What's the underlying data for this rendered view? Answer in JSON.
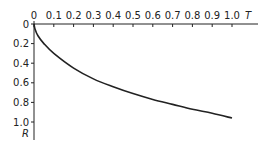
{
  "chart_data": {
    "type": "line",
    "title": "",
    "xlabel": "T",
    "ylabel": "R",
    "x_axis_position": "top",
    "y_axis_inverted": true,
    "xlim": [
      0,
      1.0
    ],
    "ylim": [
      0,
      1.0
    ],
    "grid": false,
    "legend": null,
    "x_ticks": [
      "0",
      "0.1",
      "0.2",
      "0.3",
      "0.4",
      "0.5",
      "0.6",
      "0.7",
      "0.8",
      "0.9",
      "1.0"
    ],
    "y_ticks": [
      "0",
      "0.2",
      "0.4",
      "0.6",
      "0.8",
      "1.0"
    ],
    "series": [
      {
        "name": "R(T)",
        "color": "#222222",
        "x": [
          0,
          0.005,
          0.02,
          0.05,
          0.1,
          0.2,
          0.3,
          0.4,
          0.5,
          0.6,
          0.7,
          0.8,
          0.9,
          1.0
        ],
        "y": [
          0,
          0.05,
          0.12,
          0.2,
          0.3,
          0.45,
          0.56,
          0.64,
          0.71,
          0.77,
          0.82,
          0.87,
          0.91,
          0.96
        ]
      }
    ]
  }
}
